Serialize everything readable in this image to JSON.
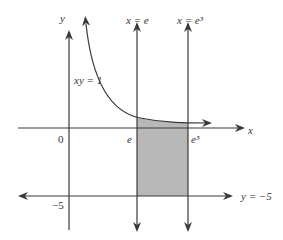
{
  "diagram": {
    "curve_label": "xy = 1",
    "axis_labels": {
      "x": "x",
      "y": "y"
    },
    "vertical_lines": [
      {
        "label": "x = e",
        "tick_label": "e"
      },
      {
        "label": "x = e³",
        "tick_label": "e³"
      }
    ],
    "horizontal_line": {
      "label": "y = −5",
      "tick_label": "−5"
    },
    "origin_label": "0",
    "colors": {
      "stroke": "#3a3a3a",
      "shade": "#b8b8b8",
      "text": "#333333"
    },
    "shaded_region": "area between xy = 1 and y = −5 from x = e to x = e³"
  }
}
